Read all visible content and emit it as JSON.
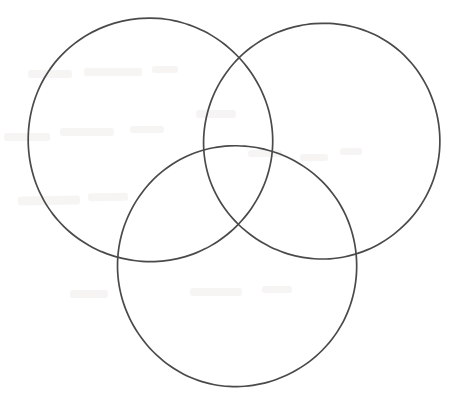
{
  "page": {
    "width": 466,
    "height": 403,
    "background_color": "#ffffff",
    "has_text": false
  },
  "diagram": {
    "name": "three-circle-venn-diagram",
    "type": "venn",
    "set_count": 3,
    "stroke_color": "#4a4a4a",
    "stroke_width": 1.7,
    "fill": "none",
    "regions_labeled": false,
    "circles": [
      {
        "id": "left",
        "name": "venn-circle-left",
        "cx": 150,
        "cy": 140,
        "r": 122,
        "label": ""
      },
      {
        "id": "right",
        "name": "venn-circle-right",
        "cx": 322,
        "cy": 141,
        "r": 118,
        "label": ""
      },
      {
        "id": "bottom",
        "name": "venn-circle-bottom",
        "cx": 237,
        "cy": 266,
        "r": 120,
        "label": ""
      }
    ],
    "intersections": [
      {
        "name": "left-right-top",
        "x": 237,
        "y": 58
      },
      {
        "name": "left-right-center",
        "x": 236,
        "y": 224
      },
      {
        "name": "left-bottom-outer",
        "x": 117,
        "y": 252
      },
      {
        "name": "left-bottom-inner",
        "x": 271,
        "y": 165
      },
      {
        "name": "right-bottom-outer",
        "x": 355,
        "y": 252
      },
      {
        "name": "right-bottom-inner",
        "x": 205,
        "y": 165
      }
    ]
  },
  "artifacts": {
    "name": "scan-ghost-marks",
    "description": "faint bleed-through smudges from reverse side of scanned page",
    "color": "#6b5a52",
    "opacity": 0.055,
    "marks": [
      {
        "x": 18,
        "y": 196,
        "w": 62,
        "h": 9,
        "rot": -1
      },
      {
        "x": 88,
        "y": 193,
        "w": 40,
        "h": 8,
        "rot": -1
      },
      {
        "x": 4,
        "y": 133,
        "w": 46,
        "h": 8,
        "rot": 0
      },
      {
        "x": 60,
        "y": 128,
        "w": 54,
        "h": 8,
        "rot": 0
      },
      {
        "x": 130,
        "y": 126,
        "w": 34,
        "h": 7,
        "rot": 0
      },
      {
        "x": 28,
        "y": 70,
        "w": 44,
        "h": 8,
        "rot": 0
      },
      {
        "x": 84,
        "y": 68,
        "w": 58,
        "h": 8,
        "rot": 0
      },
      {
        "x": 152,
        "y": 66,
        "w": 26,
        "h": 7,
        "rot": 0
      },
      {
        "x": 196,
        "y": 110,
        "w": 40,
        "h": 8,
        "rot": 0
      },
      {
        "x": 248,
        "y": 150,
        "w": 34,
        "h": 7,
        "rot": 0
      },
      {
        "x": 70,
        "y": 290,
        "w": 38,
        "h": 8,
        "rot": 0
      },
      {
        "x": 190,
        "y": 288,
        "w": 52,
        "h": 8,
        "rot": 0
      },
      {
        "x": 262,
        "y": 286,
        "w": 30,
        "h": 7,
        "rot": 0
      },
      {
        "x": 300,
        "y": 154,
        "w": 28,
        "h": 7,
        "rot": 0
      },
      {
        "x": 340,
        "y": 148,
        "w": 22,
        "h": 7,
        "rot": 0
      }
    ]
  }
}
